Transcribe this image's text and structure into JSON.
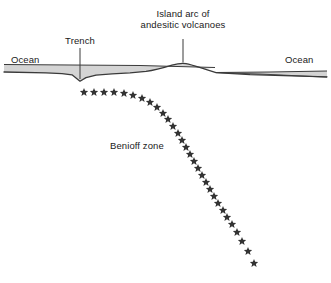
{
  "diagram": {
    "title_label": "Island arc of\nandesitic volcanoes",
    "labels": {
      "island_arc_line1": "Island arc of",
      "island_arc_line2": "andesitic volcanoes",
      "trench": "Trench",
      "ocean_left": "Ocean",
      "ocean_right": "Ocean",
      "benioff_zone": "Benioff zone"
    },
    "colors": {
      "stroke": "#3a3a3a",
      "ocean_fill": "#d4d4d4",
      "star_fill": "#333333",
      "text": "#1a1a1a",
      "background": "#ffffff"
    },
    "geometry": {
      "canvas_width": 331,
      "canvas_height": 283,
      "seafloor_path": "M 4,72 L 60,73.5 L 72,75 L 80,81 L 88,76.5 L 104,74 L 126,73 L 148,71.5 L 163,68 L 176,64.5 L 184,63.5 L 193,65 L 205,69 L 216,72.5 L 248,74.5 L 300,76 L 327,77",
      "ocean_top_left_path": "M 4,64.5 L 140,65.5 L 215,67.5",
      "ocean_top_right_path": "M 216,72.5 L 270,72 L 327,71",
      "trench_leader": {
        "x": 80,
        "y1": 48,
        "y2": 79
      },
      "volcano_leader": {
        "x": 183,
        "y1": 39,
        "y2": 63
      },
      "star_size": 9,
      "star_count": 30
    },
    "benioff_stars": [
      {
        "x": 84,
        "y": 92
      },
      {
        "x": 94,
        "y": 92
      },
      {
        "x": 104,
        "y": 92
      },
      {
        "x": 114,
        "y": 92
      },
      {
        "x": 124,
        "y": 93
      },
      {
        "x": 133,
        "y": 95
      },
      {
        "x": 142,
        "y": 98
      },
      {
        "x": 150,
        "y": 102
      },
      {
        "x": 157,
        "y": 107
      },
      {
        "x": 163,
        "y": 113
      },
      {
        "x": 168,
        "y": 119
      },
      {
        "x": 173,
        "y": 126
      },
      {
        "x": 178,
        "y": 133
      },
      {
        "x": 182,
        "y": 140
      },
      {
        "x": 186,
        "y": 147
      },
      {
        "x": 190,
        "y": 154
      },
      {
        "x": 194,
        "y": 161
      },
      {
        "x": 198,
        "y": 168
      },
      {
        "x": 202,
        "y": 175
      },
      {
        "x": 206,
        "y": 182
      },
      {
        "x": 210,
        "y": 189
      },
      {
        "x": 214,
        "y": 196
      },
      {
        "x": 218,
        "y": 203
      },
      {
        "x": 223,
        "y": 210
      },
      {
        "x": 227,
        "y": 217
      },
      {
        "x": 232,
        "y": 224
      },
      {
        "x": 237,
        "y": 232
      },
      {
        "x": 242,
        "y": 241
      },
      {
        "x": 248,
        "y": 251
      },
      {
        "x": 254,
        "y": 263
      }
    ],
    "label_positions": {
      "island_arc": {
        "x": 183,
        "y": 10
      },
      "trench": {
        "x": 80,
        "y": 38
      },
      "ocean_left": {
        "x": 30,
        "y": 58
      },
      "ocean_right": {
        "x": 303,
        "y": 58
      },
      "benioff_zone": {
        "x": 140,
        "y": 143
      }
    }
  }
}
